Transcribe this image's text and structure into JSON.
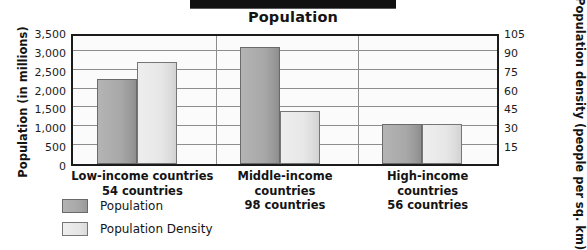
{
  "title": "Population",
  "decor": {
    "top_bar_name": "black-cropped-bar"
  },
  "axes": {
    "left_title": "Population (in millions)",
    "right_title": "Population density (people per sq. km)",
    "left_ticks": [
      "3,500",
      "3,000",
      "2,500",
      "2,000",
      "1,500",
      "1,000",
      "500",
      "0"
    ],
    "right_ticks": [
      "105",
      "90",
      "75",
      "60",
      "45",
      "30",
      "15"
    ]
  },
  "categories": [
    {
      "name": "Low-income countries",
      "count_label": "54 countries"
    },
    {
      "name": "Middle-income countries",
      "count_label": "98 countries"
    },
    {
      "name": "High-income countries",
      "count_label": "56 countries"
    }
  ],
  "legend": [
    {
      "label": "Population",
      "color": "#a8a8a8",
      "key": "population"
    },
    {
      "label": "Population Density",
      "color": "#e7e7e7",
      "key": "population_density"
    }
  ],
  "chart_data": {
    "type": "bar",
    "title": "Population",
    "xlabel": "",
    "ylabel": "Population (in millions)",
    "y2label": "Population density (people per sq. km)",
    "categories": [
      "Low-income countries",
      "Middle-income countries",
      "High-income countries"
    ],
    "category_sublabels": [
      "54 countries",
      "98 countries",
      "56 countries"
    ],
    "series": [
      {
        "name": "Population",
        "axis": "left",
        "unit": "millions",
        "values": [
          2250,
          3100,
          1050
        ]
      },
      {
        "name": "Population Density",
        "axis": "right",
        "unit": "people per sq. km",
        "values": [
          80,
          42,
          31
        ],
        "values_on_left_axis_scale": [
          2700,
          1400,
          1050
        ]
      }
    ],
    "ylim": [
      0,
      3500
    ],
    "y2lim": [
      0,
      105
    ],
    "yticks": [
      0,
      500,
      1000,
      1500,
      2000,
      2500,
      3000,
      3500
    ],
    "y2ticks": [
      15,
      30,
      45,
      60,
      75,
      90,
      105
    ],
    "grid": true,
    "legend_position": "bottom-left"
  }
}
